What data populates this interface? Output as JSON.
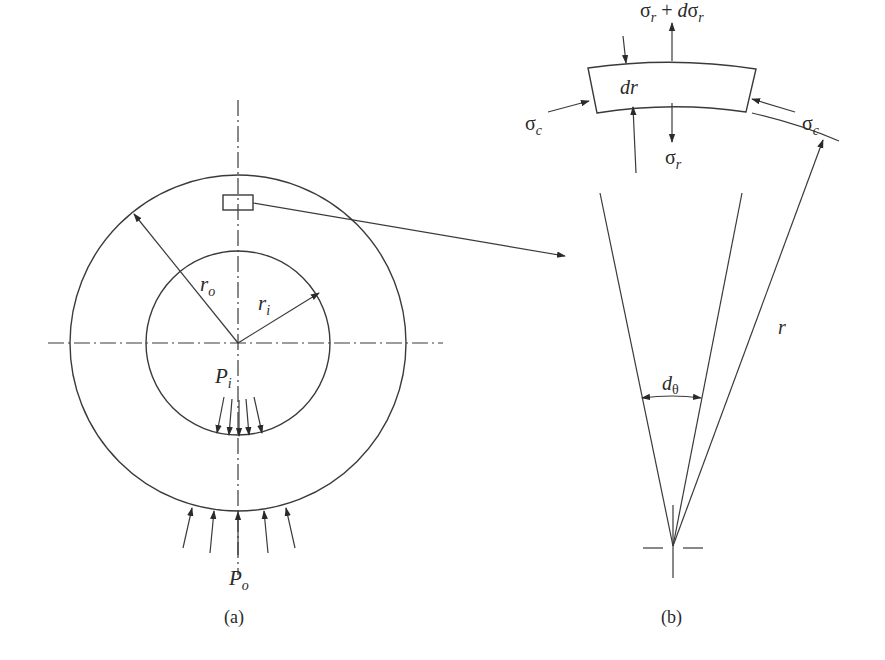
{
  "figure": {
    "panel_a": {
      "caption": "(a)",
      "labels": {
        "outer_radius": "r",
        "outer_radius_sub": "o",
        "inner_radius": "r",
        "inner_radius_sub": "i",
        "internal_pressure": "P",
        "internal_pressure_sub": "i",
        "external_pressure": "P",
        "external_pressure_sub": "o"
      }
    },
    "panel_b": {
      "caption": "(b)",
      "labels": {
        "radial_stress_outer": "σ",
        "radial_stress_outer_sub": "r",
        "radial_stress_plus": " + ",
        "radial_stress_d": "d",
        "radial_stress_outer_sigma2": "σ",
        "radial_stress_outer_sub2": "r",
        "radial_stress_inner": "σ",
        "radial_stress_inner_sub": "r",
        "circumferential_stress_left": "σ",
        "circumferential_stress_left_sub": "c",
        "circumferential_stress_right": "σ",
        "circumferential_stress_right_sub": "c",
        "element_thickness": "dr",
        "angle": "d",
        "angle_sub": "θ",
        "radius": "r"
      }
    },
    "colors": {
      "line": "#3a3a3a",
      "text": "#2a2a2a",
      "background": "#ffffff"
    }
  }
}
